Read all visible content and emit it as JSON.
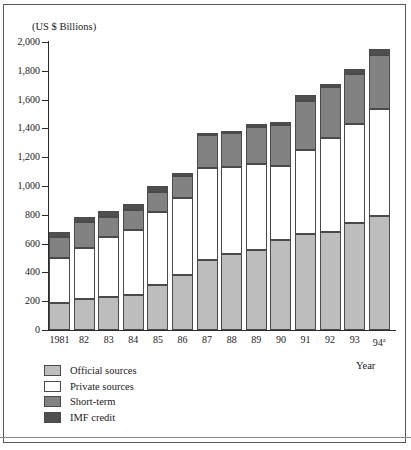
{
  "chart_data": {
    "type": "bar",
    "stacked": true,
    "title": "(US $ Billions)",
    "xlabel": "Year",
    "ylabel": "",
    "ylim": [
      0,
      2000
    ],
    "yticks": [
      0,
      200,
      400,
      600,
      800,
      1000,
      1200,
      1400,
      1600,
      1800,
      2000
    ],
    "ytick_labels": [
      "0",
      "200",
      "400",
      "600",
      "800",
      "1,000",
      "1,200",
      "1,400",
      "1,600",
      "1,800",
      "2,000"
    ],
    "grid": false,
    "legend_position": "below-left",
    "categories": [
      "1981",
      "82",
      "83",
      "84",
      "85",
      "86",
      "87",
      "88",
      "89",
      "90",
      "91",
      "92",
      "93",
      "94"
    ],
    "category_labels": [
      "1981",
      "82",
      "83",
      "84",
      "85",
      "86",
      "87",
      "88",
      "89",
      "90",
      "91",
      "92",
      "93",
      "94a"
    ],
    "footnote_marker": "a",
    "series": [
      {
        "name": "Official sources",
        "color": "#bdbdbd",
        "values": [
          185,
          213,
          228,
          242,
          312,
          385,
          488,
          525,
          558,
          625,
          670,
          683,
          745,
          795
        ]
      },
      {
        "name": "Private sources",
        "color": "#ffffff",
        "values": [
          315,
          360,
          420,
          450,
          505,
          535,
          640,
          608,
          597,
          512,
          578,
          648,
          685,
          740
        ]
      },
      {
        "name": "Short-term",
        "color": "#828282",
        "values": [
          145,
          180,
          140,
          140,
          140,
          150,
          225,
          232,
          255,
          290,
          340,
          355,
          345,
          375
        ]
      },
      {
        "name": "IMF credit",
        "color": "#4f4f4f",
        "values": [
          35,
          32,
          40,
          45,
          40,
          22,
          18,
          17,
          20,
          18,
          42,
          22,
          40,
          40
        ]
      }
    ],
    "totals": [
      680,
      785,
      828,
      877,
      997,
      1092,
      1371,
      1382,
      1430,
      1445,
      1630,
      1708,
      1815,
      1950
    ]
  },
  "legend": {
    "items": [
      {
        "label": "Official sources",
        "swatch": "s-official"
      },
      {
        "label": "Private sources",
        "swatch": "s-private"
      },
      {
        "label": "Short-term",
        "swatch": "s-short"
      },
      {
        "label": "IMF credit",
        "swatch": "s-imf"
      }
    ]
  },
  "colors": {
    "official": "#bdbdbd",
    "private": "#ffffff",
    "short_term": "#828282",
    "imf_credit": "#4f4f4f",
    "axis": "#2b2b2b",
    "frame": "#5a5a5a"
  }
}
